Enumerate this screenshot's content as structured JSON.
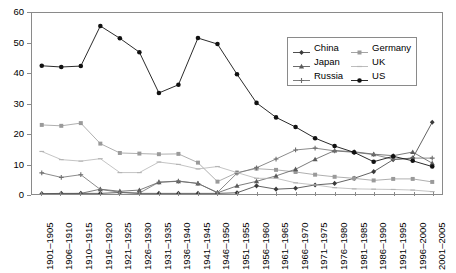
{
  "chart_data": {
    "type": "line",
    "title": "",
    "xlabel": "",
    "ylabel": "",
    "ylim": [
      0,
      60
    ],
    "ytick_step": 10,
    "grid": false,
    "legend_position": "top-right",
    "y_ticks": [
      "0",
      "10",
      "20",
      "30",
      "40",
      "50",
      "60"
    ],
    "categories": [
      "1901–1905",
      "1906–1910",
      "1910–1915",
      "1916–1920",
      "1921–1925",
      "1926–1930",
      "1931–1935",
      "1936–1940",
      "1941–1945",
      "1946–1950",
      "1951–1955",
      "1956–1960",
      "1961–1965",
      "1966–1970",
      "1971–1975",
      "1976–1980",
      "1981–1985",
      "1986–1990",
      "1991–1995",
      "1996–2000",
      "2001–2005"
    ],
    "series": [
      {
        "name": "China",
        "color": "#3a3a3a",
        "marker": "diamond",
        "values": [
          0.1,
          0.2,
          0.2,
          0.2,
          0.5,
          0.2,
          0.2,
          0.2,
          0.2,
          0.2,
          0.4,
          2.7,
          1.6,
          1.9,
          3.0,
          3.5,
          5.2,
          7.4,
          11.4,
          11.9,
          23.8
        ]
      },
      {
        "name": "Germany",
        "color": "#9a9a9a",
        "marker": "square",
        "values": [
          22.9,
          22.6,
          23.5,
          16.7,
          13.6,
          13.4,
          13.2,
          13.3,
          10.4,
          4.1,
          7.1,
          8.4,
          8.0,
          7.3,
          6.4,
          5.7,
          5.2,
          4.5,
          5.0,
          5.0,
          4.0
        ]
      },
      {
        "name": "Japan",
        "color": "#5a5a5a",
        "marker": "triangle",
        "values": [
          0.1,
          0.1,
          0.2,
          1.6,
          0.9,
          1.3,
          3.9,
          4.2,
          3.5,
          0.4,
          2.7,
          4.2,
          6.0,
          8.2,
          11.5,
          14.4,
          14.0,
          13.2,
          12.7,
          13.9,
          10.2
        ]
      },
      {
        "name": "Russia",
        "color": "#6e6e6e",
        "marker": "plus",
        "values": [
          7.0,
          5.5,
          6.4,
          1.5,
          0.6,
          0.3,
          3.9,
          4.3,
          3.5,
          0.5,
          6.9,
          8.7,
          11.6,
          14.6,
          15.2,
          14.3,
          13.8,
          13.1,
          11.5,
          11.9,
          11.9
        ]
      },
      {
        "name": "UK",
        "color": "#b5b5b5",
        "marker": "dash",
        "values": [
          14.1,
          11.4,
          10.9,
          11.7,
          7.1,
          7.1,
          10.6,
          9.8,
          8.3,
          9.1,
          7.1,
          5.2,
          5.2,
          3.7,
          3.0,
          2.1,
          1.7,
          1.6,
          1.5,
          1.3,
          0.8
        ]
      },
      {
        "name": "US",
        "color": "#111111",
        "marker": "circle",
        "values": [
          42.5,
          42.1,
          42.4,
          55.7,
          51.6,
          47.0,
          33.5,
          36.2,
          51.7,
          49.7,
          39.7,
          30.2,
          25.4,
          22.2,
          18.5,
          15.9,
          13.8,
          10.7,
          12.5,
          11.0,
          9.1
        ]
      }
    ]
  },
  "legend": {
    "entries": [
      {
        "label": "China"
      },
      {
        "label": "Germany"
      },
      {
        "label": "Japan"
      },
      {
        "label": "UK"
      },
      {
        "label": "Russia"
      },
      {
        "label": "US"
      }
    ]
  }
}
